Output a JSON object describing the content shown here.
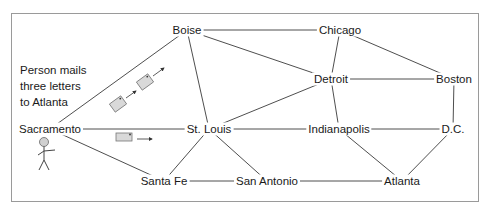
{
  "caption": {
    "lines": [
      "Person mails",
      "three letters",
      "to Atlanta"
    ]
  },
  "colors": {
    "line": "#3a3a3a",
    "frame": "#9a9a9a",
    "envelope_fill": "#d9d9d9",
    "envelope_stroke": "#777777",
    "person_head": "#d0d0d0"
  },
  "nodes": [
    {
      "id": "boise",
      "label": "Boise",
      "x": 187,
      "y": 30
    },
    {
      "id": "chicago",
      "label": "Chicago",
      "x": 340,
      "y": 30
    },
    {
      "id": "detroit",
      "label": "Detroit",
      "x": 331,
      "y": 79
    },
    {
      "id": "boston",
      "label": "Boston",
      "x": 454,
      "y": 79
    },
    {
      "id": "sacramento",
      "label": "Sacramento",
      "x": 50,
      "y": 129
    },
    {
      "id": "stlouis",
      "label": "St. Louis",
      "x": 209,
      "y": 129
    },
    {
      "id": "indianapolis",
      "label": "Indianapolis",
      "x": 339,
      "y": 129
    },
    {
      "id": "dc",
      "label": "D.C.",
      "x": 453,
      "y": 129
    },
    {
      "id": "santafe",
      "label": "Santa Fe",
      "x": 164,
      "y": 181
    },
    {
      "id": "sanantonio",
      "label": "San Antonio",
      "x": 267,
      "y": 181
    },
    {
      "id": "atlanta",
      "label": "Atlanta",
      "x": 402,
      "y": 181
    }
  ],
  "edges": [
    [
      "sacramento",
      "boise"
    ],
    [
      "sacramento",
      "stlouis"
    ],
    [
      "sacramento",
      "santafe"
    ],
    [
      "boise",
      "chicago"
    ],
    [
      "boise",
      "detroit"
    ],
    [
      "boise",
      "stlouis"
    ],
    [
      "chicago",
      "detroit"
    ],
    [
      "chicago",
      "boston"
    ],
    [
      "detroit",
      "boston"
    ],
    [
      "detroit",
      "stlouis"
    ],
    [
      "detroit",
      "indianapolis"
    ],
    [
      "stlouis",
      "indianapolis"
    ],
    [
      "stlouis",
      "santafe"
    ],
    [
      "stlouis",
      "sanantonio"
    ],
    [
      "santafe",
      "sanantonio"
    ],
    [
      "sanantonio",
      "atlanta"
    ],
    [
      "indianapolis",
      "dc"
    ],
    [
      "indianapolis",
      "atlanta"
    ],
    [
      "boston",
      "dc"
    ],
    [
      "dc",
      "atlanta"
    ]
  ],
  "letters": [
    {
      "label": "letter-1",
      "x": 118,
      "y": 104,
      "angle": -36
    },
    {
      "label": "letter-2",
      "x": 145,
      "y": 82,
      "angle": -36
    },
    {
      "label": "letter-3",
      "x": 124,
      "y": 137,
      "angle": 0
    }
  ]
}
